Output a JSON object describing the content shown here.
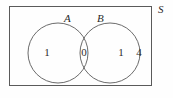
{
  "figure": {
    "type": "venn-diagram",
    "background_color": "#fefefe",
    "stroke_color": "#555555",
    "text_color": "#2b2b2b"
  },
  "universe": {
    "label": "S",
    "rect": {
      "x": 9,
      "y": 6,
      "width": 143,
      "height": 80
    }
  },
  "sets": [
    {
      "name": "set-a",
      "label": "A",
      "circle": {
        "cx": 58,
        "cy": 53,
        "r": 30
      }
    },
    {
      "name": "set-b",
      "label": "B",
      "circle": {
        "cx": 110,
        "cy": 53,
        "r": 30
      }
    }
  ],
  "regions": [
    {
      "name": "a-only",
      "label": "A only",
      "value": "1"
    },
    {
      "name": "intersection",
      "label": "A and B",
      "value": "0"
    },
    {
      "name": "b-only",
      "label": "B only",
      "value": "1"
    },
    {
      "name": "outside",
      "label": "Outside A and B",
      "value": "4"
    }
  ]
}
